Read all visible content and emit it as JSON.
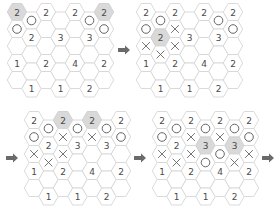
{
  "figure": {
    "colors": {
      "hex_border": "#d6d6d6",
      "hex_highlight": "#d9d9d9",
      "number_text": "#4a4a4a",
      "mark_stroke": "#555555",
      "arrow": "#6a6a6a"
    },
    "grid": {
      "columns": 7,
      "rows_per_column": 5,
      "hex_radius": 9.7,
      "col_spacing": 14.5,
      "row_spacing": 17,
      "odd_col_offset": 8.5
    },
    "legend": {
      "circle": "○",
      "cross": "×"
    },
    "panels": [
      {
        "id": "step-1",
        "origin": [
          17,
          12
        ],
        "cells": [
          [
            "2*",
            "○",
            "",
            "1",
            ""
          ],
          [
            "○",
            "2",
            "",
            "",
            "1"
          ],
          [
            "2",
            "",
            "",
            "2",
            ""
          ],
          [
            "",
            "3",
            "",
            "",
            "1"
          ],
          [
            "2",
            "",
            "",
            "4",
            ""
          ],
          [
            "○",
            "3",
            "",
            "",
            "2"
          ],
          [
            "2*",
            "○",
            "",
            "2",
            ""
          ]
        ]
      },
      {
        "id": "step-2",
        "origin": [
          146,
          12
        ],
        "cells": [
          [
            "2",
            "○",
            "×",
            "1",
            ""
          ],
          [
            "○",
            "2*",
            "×",
            "",
            "1"
          ],
          [
            "2",
            "×",
            "×",
            "2",
            ""
          ],
          [
            "",
            "3",
            "",
            "",
            "1"
          ],
          [
            "2",
            "",
            "",
            "4",
            ""
          ],
          [
            "○",
            "3",
            "",
            "",
            "2"
          ],
          [
            "2",
            "○",
            "",
            "2",
            ""
          ]
        ]
      },
      {
        "id": "step-3",
        "origin": [
          34,
          120
        ],
        "cells": [
          [
            "2",
            "○",
            "×",
            "1",
            ""
          ],
          [
            "○",
            "2",
            "×",
            "",
            "1"
          ],
          [
            "2*",
            "×",
            "×",
            "2",
            ""
          ],
          [
            "○",
            "3",
            "",
            "",
            "1"
          ],
          [
            "2*",
            "×",
            "",
            "4",
            ""
          ],
          [
            "○",
            "3",
            "",
            "",
            "2"
          ],
          [
            "2",
            "○",
            "",
            "2",
            ""
          ]
        ]
      },
      {
        "id": "step-4",
        "origin": [
          162,
          120
        ],
        "cells": [
          [
            "2",
            "○",
            "×",
            "1",
            ""
          ],
          [
            "○",
            "2",
            "×",
            "",
            "1"
          ],
          [
            "2",
            "×",
            "×",
            "2",
            ""
          ],
          [
            "○",
            "3*",
            "○",
            "",
            "1"
          ],
          [
            "2",
            "×",
            "○",
            "4",
            ""
          ],
          [
            "○",
            "3*",
            "×",
            "",
            "2"
          ],
          [
            "2",
            "○",
            "×",
            "2",
            ""
          ]
        ]
      }
    ],
    "arrows": [
      {
        "id": "arrow-1-to-2",
        "x": 124,
        "y": 50
      },
      {
        "id": "arrow-2-to-3",
        "x": 12,
        "y": 158
      },
      {
        "id": "arrow-3-to-4",
        "x": 140,
        "y": 158
      },
      {
        "id": "arrow-4-to-next",
        "x": 268,
        "y": 158
      }
    ],
    "cell_notation": "'*' suffix marks a gray-highlighted cell; '○' = circle mark; '×' = cross mark; '' = empty hex"
  }
}
